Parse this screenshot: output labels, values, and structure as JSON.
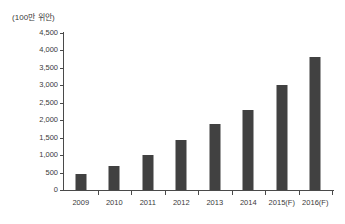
{
  "chart_data": {
    "type": "bar",
    "title": "",
    "subtitle": "",
    "unit_label": "(100만 위안)",
    "xlabel": "",
    "ylabel": "",
    "categories": [
      "2009",
      "2010",
      "2011",
      "2012",
      "2013",
      "2014",
      "2015(F)",
      "2016(F)"
    ],
    "values": [
      470,
      700,
      1010,
      1440,
      1890,
      2280,
      3020,
      3810
    ],
    "series": [
      {
        "name": "",
        "values": [
          470,
          700,
          1010,
          1440,
          1890,
          2280,
          3020,
          3810
        ]
      }
    ],
    "ylim": [
      0,
      4500
    ],
    "ytick_values": [
      0,
      500,
      1000,
      1500,
      2000,
      2500,
      3000,
      3500,
      4000,
      4500
    ],
    "ytick_labels": [
      "0",
      "500",
      "1,000",
      "1,500",
      "2,000",
      "2,500",
      "3,000",
      "3,500",
      "4,000",
      "4,500"
    ],
    "grid": false,
    "legend": false,
    "legend_position": "none",
    "bar_color": "#414141",
    "axis_color": "#4a4a4a",
    "text_color": "#3a3a3a",
    "background_color": "#ffffff",
    "annotations": []
  }
}
